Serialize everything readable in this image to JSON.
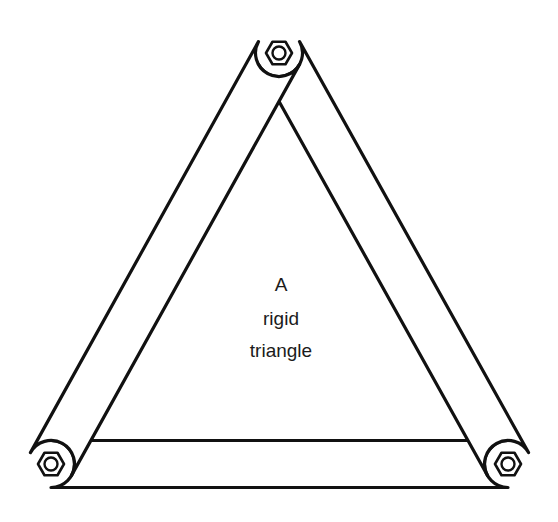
{
  "diagram": {
    "title": "A rigid triangle",
    "background_color": "#ffffff",
    "stroke_color": "#111111",
    "fill_color": "#ffffff",
    "text_color": "#1b1b1b",
    "caption": {
      "lines": [
        "A",
        "rigid",
        "triangle"
      ],
      "line1": "A",
      "line2": "rigid",
      "line3": "triangle",
      "center_x": 281,
      "line_y": [
        291,
        325,
        357
      ],
      "font_size_px": 19
    },
    "joints": [
      {
        "name": "top-joint",
        "label": "top",
        "x": 279,
        "y": 53
      },
      {
        "name": "bottom-left-joint",
        "label": "bottom-left",
        "x": 51,
        "y": 464
      },
      {
        "name": "bottom-right-joint",
        "label": "bottom-right",
        "x": 508,
        "y": 464
      }
    ],
    "bolts": [
      {
        "name": "bolt-top",
        "cx": 279,
        "cy": 53,
        "hex_radius": 13,
        "ring_radius": 6.5
      },
      {
        "name": "bolt-bottom-left",
        "cx": 51,
        "cy": 464,
        "hex_radius": 13,
        "ring_radius": 6.5
      },
      {
        "name": "bolt-bottom-right",
        "cx": 508,
        "cy": 464,
        "hex_radius": 13,
        "ring_radius": 6.5
      }
    ],
    "bars": [
      {
        "name": "bar-bottom",
        "label": "bottom horizontal bar",
        "from": "bottom-left-joint",
        "to": "bottom-right-joint",
        "half_width": 23.5,
        "draw_order": 1
      },
      {
        "name": "bar-right",
        "label": "right diagonal bar",
        "from": "top-joint",
        "to": "bottom-right-joint",
        "half_width": 23.5,
        "draw_order": 2
      },
      {
        "name": "bar-left",
        "label": "left diagonal bar",
        "from": "top-joint",
        "to": "bottom-left-joint",
        "half_width": 23.5,
        "draw_order": 3
      }
    ]
  }
}
